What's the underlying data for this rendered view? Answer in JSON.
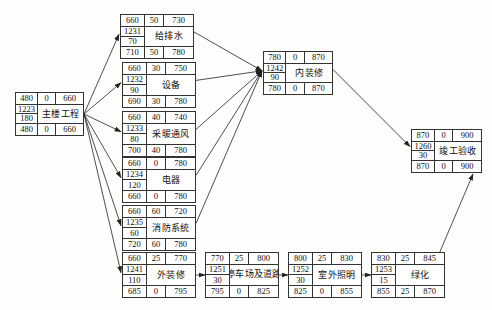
{
  "diagram": {
    "type": "network-schedule",
    "column_headers": [
      "ES",
      "FF",
      "EF",
      "编号",
      "工期",
      "LS",
      "TF",
      "LF"
    ],
    "colors": {
      "node_border": "#333333",
      "node_fill": "#ffffff",
      "edge": "#222222",
      "background": "#fdfdfc"
    }
  },
  "nodes": [
    {
      "id": "main-building",
      "name": "主楼工程",
      "code": "1223",
      "duration": "180",
      "top": {
        "left": "480",
        "mid": "0",
        "right": "660"
      },
      "bottom": {
        "left": "480",
        "mid": "0",
        "right": "660"
      },
      "x": 15,
      "y": 92,
      "w": 69,
      "h": 44,
      "wrap": false
    },
    {
      "id": "water-supply-drainage",
      "name": "给排水",
      "code": "1231",
      "duration": "70",
      "top": {
        "left": "660",
        "mid": "50",
        "right": "730"
      },
      "bottom": {
        "left": "710",
        "mid": "50",
        "right": "780"
      },
      "x": 120,
      "y": 14,
      "w": 74,
      "h": 45,
      "wrap": false
    },
    {
      "id": "equipment",
      "name": "设备",
      "code": "1232",
      "duration": "90",
      "top": {
        "left": "660",
        "mid": "30",
        "right": "750"
      },
      "bottom": {
        "left": "690",
        "mid": "30",
        "right": "780"
      },
      "x": 122,
      "y": 62,
      "w": 74,
      "h": 46,
      "wrap": false
    },
    {
      "id": "heating-ventilation",
      "name": "采暖通风",
      "code": "1233",
      "duration": "80",
      "top": {
        "left": "660",
        "mid": "40",
        "right": "740"
      },
      "bottom": {
        "left": "700",
        "mid": "40",
        "right": "780"
      },
      "x": 122,
      "y": 111,
      "w": 74,
      "h": 46,
      "wrap": false
    },
    {
      "id": "electrical",
      "name": "电器",
      "code": "1234",
      "duration": "120",
      "top": {
        "left": "660",
        "mid": "0",
        "right": "780"
      },
      "bottom": {
        "left": "660",
        "mid": "0",
        "right": "780"
      },
      "x": 122,
      "y": 157,
      "w": 74,
      "h": 46,
      "wrap": false
    },
    {
      "id": "fire-protection-system",
      "name": "消防系统",
      "code": "1235",
      "duration": "60",
      "top": {
        "left": "660",
        "mid": "60",
        "right": "720"
      },
      "bottom": {
        "left": "720",
        "mid": "60",
        "right": "780"
      },
      "x": 122,
      "y": 205,
      "w": 74,
      "h": 46,
      "wrap": false
    },
    {
      "id": "interior-decoration",
      "name": "内装修",
      "code": "1242",
      "duration": "90",
      "top": {
        "left": "780",
        "mid": "0",
        "right": "870"
      },
      "bottom": {
        "left": "780",
        "mid": "0",
        "right": "870"
      },
      "x": 263,
      "y": 51,
      "w": 70,
      "h": 44,
      "wrap": false
    },
    {
      "id": "completion-acceptance",
      "name": "竣工验收",
      "code": "1260",
      "duration": "30",
      "top": {
        "left": "870",
        "mid": "0",
        "right": "900"
      },
      "bottom": {
        "left": "870",
        "mid": "0",
        "right": "900"
      },
      "x": 411,
      "y": 129,
      "w": 71,
      "h": 44,
      "wrap": false
    },
    {
      "id": "exterior-decoration",
      "name": "外装修",
      "code": "1241",
      "duration": "110",
      "top": {
        "left": "660",
        "mid": "25",
        "right": "770"
      },
      "bottom": {
        "left": "685",
        "mid": "0",
        "right": "795"
      },
      "x": 122,
      "y": 252,
      "w": 74,
      "h": 46,
      "wrap": false
    },
    {
      "id": "parking-and-roads",
      "name": "停车场及道路",
      "code": "1251",
      "duration": "30",
      "top": {
        "left": "770",
        "mid": "25",
        "right": "800"
      },
      "bottom": {
        "left": "795",
        "mid": "0",
        "right": "825"
      },
      "x": 205,
      "y": 252,
      "w": 74,
      "h": 46,
      "wrap": true
    },
    {
      "id": "outdoor-lighting",
      "name": "室外照明",
      "code": "1252",
      "duration": "30",
      "top": {
        "left": "800",
        "mid": "25",
        "right": "830"
      },
      "bottom": {
        "left": "825",
        "mid": "0",
        "right": "855"
      },
      "x": 288,
      "y": 252,
      "w": 74,
      "h": 46,
      "wrap": false
    },
    {
      "id": "landscaping",
      "name": "绿化",
      "code": "1253",
      "duration": "15",
      "top": {
        "left": "830",
        "mid": "25",
        "right": "845"
      },
      "bottom": {
        "left": "855",
        "mid": "25",
        "right": "870"
      },
      "x": 371,
      "y": 252,
      "w": 74,
      "h": 46,
      "wrap": false
    }
  ],
  "edges": [
    {
      "from": "main-building",
      "to": "water-supply-drainage"
    },
    {
      "from": "main-building",
      "to": "equipment"
    },
    {
      "from": "main-building",
      "to": "heating-ventilation"
    },
    {
      "from": "main-building",
      "to": "electrical"
    },
    {
      "from": "main-building",
      "to": "fire-protection-system"
    },
    {
      "from": "main-building",
      "to": "exterior-decoration"
    },
    {
      "from": "water-supply-drainage",
      "to": "interior-decoration"
    },
    {
      "from": "equipment",
      "to": "interior-decoration"
    },
    {
      "from": "heating-ventilation",
      "to": "interior-decoration"
    },
    {
      "from": "electrical",
      "to": "interior-decoration"
    },
    {
      "from": "fire-protection-system",
      "to": "interior-decoration"
    },
    {
      "from": "interior-decoration",
      "to": "completion-acceptance"
    },
    {
      "from": "exterior-decoration",
      "to": "parking-and-roads"
    },
    {
      "from": "parking-and-roads",
      "to": "outdoor-lighting"
    },
    {
      "from": "outdoor-lighting",
      "to": "landscaping"
    },
    {
      "from": "landscaping",
      "to": "completion-acceptance"
    }
  ]
}
